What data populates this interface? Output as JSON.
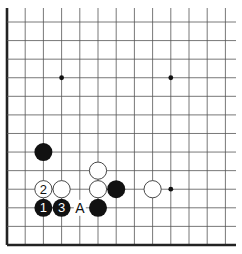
{
  "diagram": {
    "type": "go-board-fragment",
    "columns": 13,
    "rows": 13,
    "edges": {
      "left": true,
      "bottom": true,
      "top": false,
      "right": false
    },
    "star_points": [
      {
        "col": 3,
        "row": 3
      },
      {
        "col": 9,
        "row": 3
      },
      {
        "col": 9,
        "row": 9
      }
    ],
    "stones": [
      {
        "color": "black",
        "col": 2,
        "row": 7,
        "label": ""
      },
      {
        "color": "white",
        "col": 2,
        "row": 9,
        "label": "2"
      },
      {
        "color": "white",
        "col": 3,
        "row": 9,
        "label": ""
      },
      {
        "color": "white",
        "col": 5,
        "row": 8,
        "label": ""
      },
      {
        "color": "white",
        "col": 5,
        "row": 9,
        "label": ""
      },
      {
        "color": "black",
        "col": 6,
        "row": 9,
        "label": ""
      },
      {
        "color": "white",
        "col": 8,
        "row": 9,
        "label": ""
      },
      {
        "color": "black",
        "col": 2,
        "row": 10,
        "label": "1"
      },
      {
        "color": "black",
        "col": 3,
        "row": 10,
        "label": "3"
      },
      {
        "color": "black",
        "col": 5,
        "row": 10,
        "label": ""
      }
    ],
    "markers": [
      {
        "col": 4,
        "row": 10,
        "label": "A"
      }
    ],
    "colors": {
      "line": "#555555",
      "edge": "#222222",
      "black_stone": "#111111",
      "white_stone": "#ffffff"
    }
  }
}
